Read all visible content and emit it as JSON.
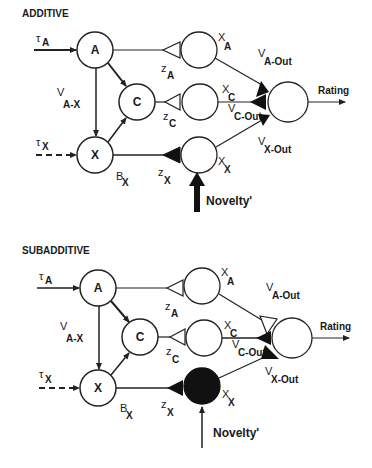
{
  "panels": [
    {
      "title": "ADDITIVE",
      "nodes": {
        "a": "A",
        "c": "C",
        "x": "X"
      },
      "inputs": {
        "tau_a": {
          "sym": "τ",
          "sub": "A"
        },
        "tau_x": {
          "sym": "τ",
          "sub": "X"
        }
      },
      "labels": {
        "v_ax": {
          "sym": "V",
          "sub": "A-X"
        },
        "b_x": {
          "sym": "B",
          "sub": "X"
        },
        "z_a": {
          "sym": "z",
          "sub": "A"
        },
        "z_c": {
          "sym": "z",
          "sub": "C"
        },
        "z_x": {
          "sym": "z",
          "sub": "X"
        },
        "x_a": {
          "sym": "X",
          "sub": "A"
        },
        "x_c": {
          "sym": "X",
          "sub": "C"
        },
        "x_x": {
          "sym": "X",
          "sub": "X"
        },
        "v_aout": {
          "sym": "V",
          "sub": "A-Out"
        },
        "v_cout": {
          "sym": "V",
          "sub": "C-Out"
        },
        "v_xout": {
          "sym": "V",
          "sub": "X-Out"
        }
      },
      "output": "Rating",
      "novelty": "Novelty'",
      "novelty_arrow": "thick",
      "x_unit_state": "inactive",
      "synapses": {
        "z_a": "hollow",
        "z_c": "hollow",
        "z_x": "filled",
        "v_aout": "filled",
        "v_cout": "filled",
        "v_xout": "filled"
      }
    },
    {
      "title": "SUBADDITIVE",
      "nodes": {
        "a": "A",
        "c": "C",
        "x": "X"
      },
      "inputs": {
        "tau_a": {
          "sym": "τ",
          "sub": "A"
        },
        "tau_x": {
          "sym": "τ",
          "sub": "X"
        }
      },
      "labels": {
        "v_ax": {
          "sym": "V",
          "sub": "A-X"
        },
        "b_x": {
          "sym": "B",
          "sub": "X"
        },
        "z_a": {
          "sym": "z",
          "sub": "A"
        },
        "z_c": {
          "sym": "z",
          "sub": "C"
        },
        "z_x": {
          "sym": "z",
          "sub": "X"
        },
        "x_a": {
          "sym": "X",
          "sub": "A"
        },
        "x_c": {
          "sym": "X",
          "sub": "C"
        },
        "x_x": {
          "sym": "X",
          "sub": "X"
        },
        "v_aout": {
          "sym": "V",
          "sub": "A-Out"
        },
        "v_cout": {
          "sym": "V",
          "sub": "C-Out"
        },
        "v_xout": {
          "sym": "V",
          "sub": "X-Out"
        }
      },
      "output": "Rating",
      "novelty": "Novelty'",
      "novelty_arrow": "thin",
      "x_unit_state": "active-filled",
      "synapses": {
        "z_a": "hollow",
        "z_c": "hollow",
        "z_x": "filled",
        "v_aout": "hollow",
        "v_cout": "filled",
        "v_xout": "filled"
      }
    }
  ],
  "colors": {
    "stroke": "#222222",
    "fill_active": "#111111",
    "background": "#ffffff"
  }
}
